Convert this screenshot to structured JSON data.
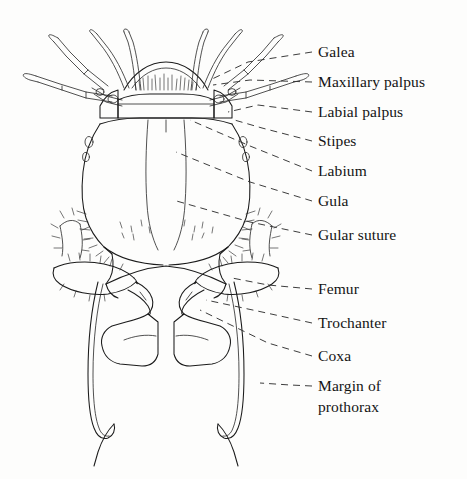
{
  "figure": {
    "background_color": "#fdfdfc",
    "ink_color": "#1b1b1b",
    "leader_style": "dashed"
  },
  "labels": [
    {
      "id": "galea",
      "text": "Galea",
      "x": 318,
      "y": 57,
      "leader": [
        [
          312,
          52
        ],
        [
          248,
          62
        ],
        [
          210,
          80
        ]
      ]
    },
    {
      "id": "maxillary-palpus",
      "text": "Maxillary palpus",
      "x": 318,
      "y": 87,
      "leader": [
        [
          312,
          82
        ],
        [
          250,
          80
        ],
        [
          213,
          85
        ]
      ]
    },
    {
      "id": "labial-palpus",
      "text": "Labial palpus",
      "x": 318,
      "y": 117,
      "leader": [
        [
          312,
          112
        ],
        [
          258,
          105
        ],
        [
          228,
          112
        ]
      ]
    },
    {
      "id": "stipes",
      "text": "Stipes",
      "x": 318,
      "y": 146,
      "leader": [
        [
          312,
          141
        ],
        [
          262,
          128
        ],
        [
          231,
          119
        ]
      ]
    },
    {
      "id": "labium",
      "text": "Labium",
      "x": 318,
      "y": 176,
      "leader": [
        [
          312,
          171
        ],
        [
          250,
          146
        ],
        [
          190,
          120
        ]
      ]
    },
    {
      "id": "gula",
      "text": "Gula",
      "x": 318,
      "y": 206,
      "leader": [
        [
          312,
          201
        ],
        [
          250,
          182
        ],
        [
          176,
          152
        ]
      ]
    },
    {
      "id": "gular-suture",
      "text": "Gular suture",
      "x": 318,
      "y": 240,
      "leader": [
        [
          312,
          235
        ],
        [
          250,
          222
        ],
        [
          173,
          200
        ]
      ]
    },
    {
      "id": "femur",
      "text": "Femur",
      "x": 318,
      "y": 294,
      "leader": [
        [
          312,
          289
        ],
        [
          268,
          285
        ],
        [
          232,
          278
        ]
      ]
    },
    {
      "id": "trochanter",
      "text": "Trochanter",
      "x": 318,
      "y": 328,
      "leader": [
        [
          312,
          323
        ],
        [
          262,
          312
        ],
        [
          206,
          300
        ]
      ]
    },
    {
      "id": "coxa",
      "text": "Coxa",
      "x": 318,
      "y": 361,
      "leader": [
        [
          312,
          356
        ],
        [
          268,
          343
        ],
        [
          200,
          310
        ]
      ]
    },
    {
      "id": "margin-of-prothorax",
      "text": "Margin of",
      "x": 318,
      "y": 391,
      "leader": [
        [
          312,
          386
        ],
        [
          290,
          385
        ],
        [
          260,
          383
        ]
      ]
    },
    {
      "id": "margin-of-prothorax-2",
      "text": "prothorax",
      "x": 318,
      "y": 412,
      "leader": null
    }
  ]
}
